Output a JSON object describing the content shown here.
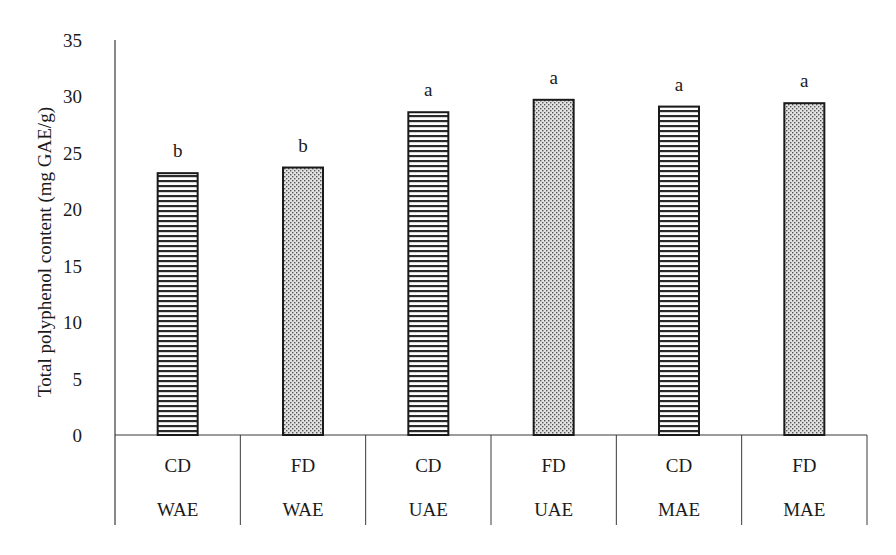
{
  "chart_data": {
    "type": "bar",
    "title": "",
    "xlabel": "",
    "ylabel": "Total polyphenol content  (mg GAE/g)",
    "ylim": [
      0,
      35
    ],
    "yticks": [
      0,
      5,
      10,
      15,
      20,
      25,
      30,
      35
    ],
    "grid": false,
    "legend": null,
    "categories": [
      {
        "drying": "CD",
        "extraction": "WAE"
      },
      {
        "drying": "FD",
        "extraction": "WAE"
      },
      {
        "drying": "CD",
        "extraction": "UAE"
      },
      {
        "drying": "FD",
        "extraction": "UAE"
      },
      {
        "drying": "CD",
        "extraction": "MAE"
      },
      {
        "drying": "FD",
        "extraction": "MAE"
      }
    ],
    "values": [
      23.2,
      23.7,
      28.6,
      29.7,
      29.1,
      29.4
    ],
    "significance_letters": [
      "b",
      "b",
      "a",
      "a",
      "a",
      "a"
    ],
    "patterns": [
      "horizontal-stripes",
      "dots",
      "horizontal-stripes",
      "dots",
      "horizontal-stripes",
      "dots"
    ]
  },
  "colors": {
    "axis": "#3a3a3a",
    "bar_outline": "#1a1a1a",
    "stripe": "#2a2a2a",
    "dot": "#555555",
    "dot_bg": "#d8d8d8",
    "text": "#1a1a1a"
  }
}
